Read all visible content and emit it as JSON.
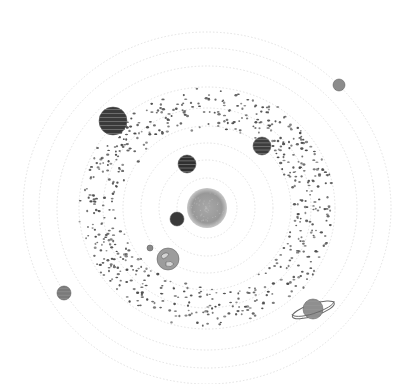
{
  "colors": {
    "background": "#ffffff",
    "orbit": "#d9d9d9",
    "asteroid": "#4a4a4a",
    "sun": "#9a9a9a",
    "sun_edge": "#c4c4c4"
  },
  "center": {
    "x": 207,
    "y": 208
  },
  "orbits": [
    {
      "rx": 30,
      "ry": 30
    },
    {
      "rx": 48,
      "ry": 48
    },
    {
      "rx": 66,
      "ry": 65
    },
    {
      "rx": 84,
      "ry": 82
    },
    {
      "rx": 104,
      "ry": 100
    },
    {
      "rx": 128,
      "ry": 121
    },
    {
      "rx": 150,
      "ry": 142
    },
    {
      "rx": 168,
      "ry": 160
    },
    {
      "rx": 184,
      "ry": 176
    }
  ],
  "asteroid_belt": {
    "rx_inner": 88,
    "rx_outter": 126,
    "rx_outer": 126,
    "ry_inner": 80,
    "ry_outer": 118,
    "count": 620,
    "seed": 7
  },
  "sun": {
    "name": "Sun",
    "x": 207,
    "y": 208,
    "r": 20
  },
  "planets": [
    {
      "name": "Mercury",
      "x": 177,
      "y": 219,
      "r": 7,
      "fill": "#3a3a3a",
      "stripes": false
    },
    {
      "name": "Venus",
      "x": 187,
      "y": 164,
      "r": 9,
      "fill": "#2f2f2f",
      "stripes": true
    },
    {
      "name": "Earth",
      "x": 168,
      "y": 259,
      "r": 11,
      "fill": "#9c9c9c",
      "stripes": false,
      "continents": true
    },
    {
      "name": "Moon",
      "x": 150,
      "y": 248,
      "r": 3,
      "fill": "#8a8a8a",
      "stripes": false
    },
    {
      "name": "Mars",
      "x": 262,
      "y": 146,
      "r": 9,
      "fill": "#3d3d3d",
      "stripes": true
    },
    {
      "name": "Jupiter",
      "x": 113,
      "y": 121,
      "r": 14,
      "fill": "#3a3a3a",
      "stripes": true
    },
    {
      "name": "Saturn",
      "x": 313,
      "y": 309,
      "r": 10,
      "fill": "#8f8f8f",
      "stripes": true,
      "ring": true
    },
    {
      "name": "Uranus",
      "x": 64,
      "y": 293,
      "r": 7,
      "fill": "#7a7a7a",
      "stripes": true
    },
    {
      "name": "Neptune",
      "x": 339,
      "y": 85,
      "r": 6,
      "fill": "#8c8c8c",
      "stripes": false
    }
  ]
}
